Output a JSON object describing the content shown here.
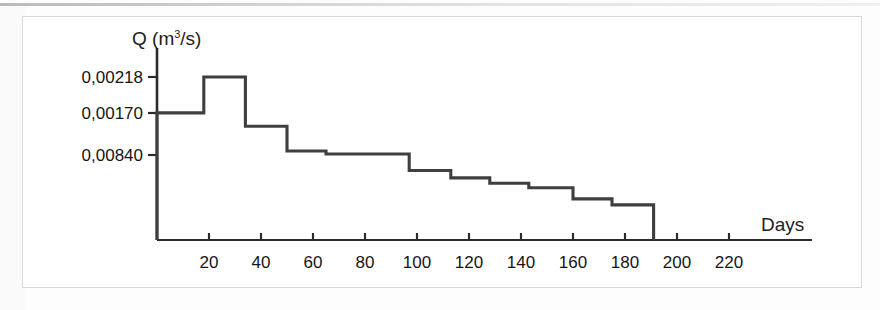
{
  "figure": {
    "kind": "scanned-figure",
    "frame_color": "#d9d9d9",
    "background": "#ffffff"
  },
  "chart_data": {
    "type": "line",
    "subtype": "step",
    "title": "",
    "subtitle": "",
    "xlabel": "Days",
    "ylabel": "Q (m³/s)",
    "ylabel_symbol": "Q",
    "ylabel_unit": "m³/s",
    "grid": false,
    "legend": null,
    "line_color": "#3f3f3f",
    "line_width_px": 3,
    "axis_color": "#2b2b2b",
    "xlim": [
      0,
      235
    ],
    "ylim": [
      0,
      0.00245
    ],
    "xticks": [
      20,
      40,
      60,
      80,
      100,
      120,
      140,
      160,
      180,
      200,
      220
    ],
    "xtick_labels": [
      "20",
      "40",
      "60",
      "80",
      "100",
      "120",
      "140",
      "160",
      "180",
      "200",
      "220"
    ],
    "ytick_values": [
      0.00218,
      0.0017,
      0.00084
    ],
    "ytick_labels": [
      "0,00218",
      "0,00170",
      "0,00840"
    ],
    "x": [
      0,
      0,
      18,
      18,
      34,
      34,
      50,
      50,
      65,
      65,
      97,
      97,
      113,
      113,
      128,
      128,
      143,
      143,
      160,
      160,
      175,
      175,
      191,
      191
    ],
    "y": [
      0,
      0.0017,
      0.0017,
      0.00218,
      0.00218,
      0.00152,
      0.00152,
      0.00119,
      0.00119,
      0.00115,
      0.00115,
      0.00093,
      0.00093,
      0.00083,
      0.00083,
      0.00076,
      0.00076,
      0.0007,
      0.0007,
      0.00055,
      0.00055,
      0.00047,
      0.00047,
      0
    ],
    "steps": [
      {
        "from_day": 0,
        "to_day": 18,
        "value": 0.0017
      },
      {
        "from_day": 18,
        "to_day": 34,
        "value": 0.00218
      },
      {
        "from_day": 34,
        "to_day": 50,
        "value": 0.00152
      },
      {
        "from_day": 50,
        "to_day": 65,
        "value": 0.00119
      },
      {
        "from_day": 65,
        "to_day": 97,
        "value": 0.00115
      },
      {
        "from_day": 97,
        "to_day": 113,
        "value": 0.00093
      },
      {
        "from_day": 113,
        "to_day": 128,
        "value": 0.00083
      },
      {
        "from_day": 128,
        "to_day": 143,
        "value": 0.00076
      },
      {
        "from_day": 143,
        "to_day": 160,
        "value": 0.0007
      },
      {
        "from_day": 160,
        "to_day": 175,
        "value": 0.00055
      },
      {
        "from_day": 175,
        "to_day": 191,
        "value": 0.00047
      }
    ]
  }
}
